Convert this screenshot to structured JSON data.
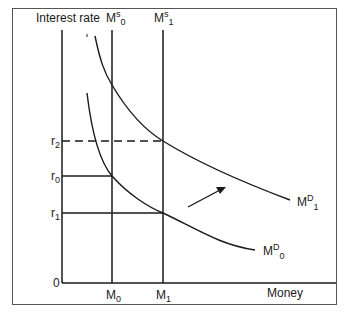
{
  "diagram": {
    "y_axis_label": "Interest rate",
    "x_axis_label": "Money",
    "origin_label": "0",
    "colors": {
      "line": "#1a1a1a",
      "frame": "#555555",
      "background": "#ffffff"
    },
    "supply_curves": [
      {
        "base": "M",
        "sup": "s",
        "sub": "0",
        "quantity_label_base": "M",
        "quantity_label_sub": "0"
      },
      {
        "base": "M",
        "sup": "s",
        "sub": "1",
        "quantity_label_base": "M",
        "quantity_label_sub": "1"
      }
    ],
    "demand_curves": [
      {
        "base": "M",
        "sup": "D",
        "sub": "0"
      },
      {
        "base": "M",
        "sup": "D",
        "sub": "1"
      }
    ],
    "interest_rates": [
      {
        "base": "r",
        "sub": "2",
        "style": "dashed"
      },
      {
        "base": "r",
        "sub": "0",
        "style": "solid"
      },
      {
        "base": "r",
        "sub": "1",
        "style": "solid"
      }
    ],
    "shift_arrow": "Demand shifts outward from MD0 to MD1"
  }
}
